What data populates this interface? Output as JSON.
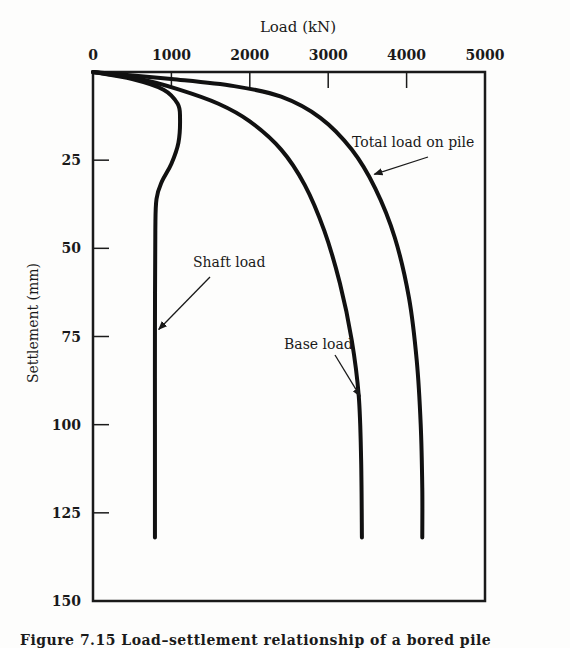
{
  "chart_data": {
    "type": "line",
    "title": "",
    "xlabel": "Load (kN)",
    "ylabel": "Settlement (mm)",
    "x_axis_position": "top",
    "y_axis_inverted": true,
    "xlim": [
      0,
      5000
    ],
    "ylim": [
      0,
      150
    ],
    "x_ticks": [
      0,
      1000,
      2000,
      3000,
      4000,
      5000
    ],
    "y_ticks": [
      25,
      50,
      75,
      100,
      125,
      150
    ],
    "grid": false,
    "legend": "inline annotations with arrows",
    "series": [
      {
        "name": "Shaft load",
        "points": [
          [
            0,
            0
          ],
          [
            500,
            2
          ],
          [
            900,
            5
          ],
          [
            1080,
            9
          ],
          [
            1110,
            13
          ],
          [
            1090,
            20
          ],
          [
            1000,
            26
          ],
          [
            880,
            31
          ],
          [
            810,
            36
          ],
          [
            795,
            45
          ],
          [
            790,
            75
          ],
          [
            790,
            100
          ],
          [
            790,
            132
          ]
        ]
      },
      {
        "name": "Base load",
        "points": [
          [
            0,
            0
          ],
          [
            600,
            2
          ],
          [
            1100,
            5
          ],
          [
            1600,
            9
          ],
          [
            2000,
            14
          ],
          [
            2400,
            22
          ],
          [
            2700,
            32
          ],
          [
            2950,
            45
          ],
          [
            3150,
            60
          ],
          [
            3300,
            76
          ],
          [
            3390,
            92
          ],
          [
            3420,
            110
          ],
          [
            3430,
            132
          ]
        ]
      },
      {
        "name": "Total load on pile",
        "points": [
          [
            0,
            0
          ],
          [
            1000,
            2
          ],
          [
            1800,
            4
          ],
          [
            2400,
            7
          ],
          [
            2900,
            13
          ],
          [
            3300,
            22
          ],
          [
            3600,
            33
          ],
          [
            3850,
            47
          ],
          [
            4030,
            64
          ],
          [
            4130,
            82
          ],
          [
            4180,
            100
          ],
          [
            4200,
            118
          ],
          [
            4200,
            132
          ]
        ]
      }
    ],
    "annotations": [
      {
        "text": "Total load on pile",
        "arrow_to": [
          3550,
          29
        ]
      },
      {
        "text": "Shaft load",
        "arrow_to": [
          800,
          73
        ]
      },
      {
        "text": "Base load",
        "arrow_to": [
          3370,
          92
        ]
      }
    ]
  },
  "labels": {
    "x_title": "Load (kN)",
    "y_title": "Settlement (mm)",
    "x_ticks": [
      "0",
      "1000",
      "2000",
      "3000",
      "4000",
      "5000"
    ],
    "y_ticks": [
      "25",
      "50",
      "75",
      "100",
      "125",
      "150"
    ],
    "ann_total": "Total load on pile",
    "ann_shaft": "Shaft load",
    "ann_base": "Base load",
    "caption": "Figure 7.15 Load–settlement relationship of a bored pile"
  }
}
